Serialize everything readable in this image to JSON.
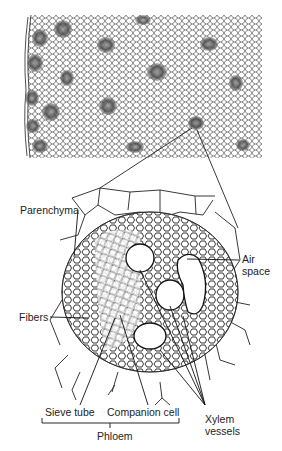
{
  "figure": {
    "top_panel": {
      "description": "Cross-section of monocot stem showing scattered vascular bundles in ground parenchyma",
      "highlighted_bundle": "enlarged below"
    },
    "bottom_panel": {
      "description": "Enlarged single vascular bundle"
    },
    "labels": {
      "parenchyma": "Parenchyma",
      "air_space_line1": "Air",
      "air_space_line2": "space",
      "fibers": "Fibers",
      "sieve_tube": "Sieve tube",
      "companion_cell": "Companion cell",
      "xylem_line1": "Xylem",
      "xylem_line2": "vessels",
      "phloem": "Phloem"
    },
    "colors": {
      "line": "#222222",
      "background": "#ffffff",
      "bundle_fill": "#555555"
    }
  }
}
